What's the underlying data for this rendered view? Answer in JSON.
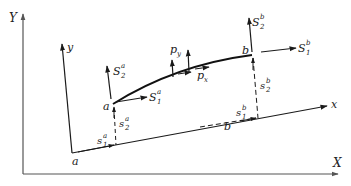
{
  "diagram": {
    "type": "coordinate-frame beam element",
    "global_axes": {
      "x_label": "X",
      "y_label": "Y"
    },
    "local_axes": {
      "x_label": "x",
      "y_label": "y",
      "origin_label": "a"
    },
    "curve_points": {
      "start": "a",
      "end": "b"
    },
    "projection_point_b": "b",
    "forces": {
      "S1a": {
        "base": "S",
        "sub": "1",
        "sup": "a"
      },
      "S2a": {
        "base": "S",
        "sub": "2",
        "sup": "a"
      },
      "S1b": {
        "base": "S",
        "sub": "1",
        "sup": "b"
      },
      "S2b": {
        "base": "S",
        "sub": "2",
        "sup": "b"
      },
      "px": {
        "base": "p",
        "sub": "x"
      },
      "py": {
        "base": "p",
        "sub": "y"
      }
    },
    "displacements": {
      "s1a": {
        "base": "s",
        "sub": "1",
        "sup": "a"
      },
      "s2a": {
        "base": "s",
        "sub": "2",
        "sup": "a"
      },
      "s1b": {
        "base": "s",
        "sub": "1",
        "sup": "b"
      },
      "s2b": {
        "base": "s",
        "sub": "2",
        "sup": "b"
      }
    },
    "colors": {
      "line": "#1a1a1a",
      "axis": "#555555"
    }
  }
}
